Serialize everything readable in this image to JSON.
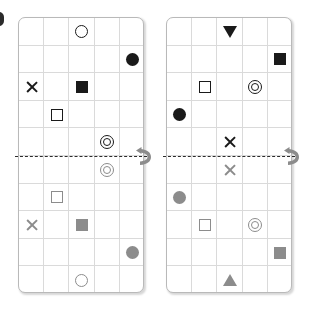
{
  "figure": {
    "kind": "mirror-reflection-grid-puzzle",
    "panel_count": 2,
    "grid": {
      "columns": 5,
      "rows_per_half": 5,
      "total_rows": 10
    },
    "mirror": {
      "orientation": "horizontal",
      "line_style": "dashed",
      "line_color": "#2b2b2b",
      "position_row": 5,
      "icon_name": "flip-vertical-icon",
      "icon_label": "flip"
    },
    "colors": {
      "source_symbol": "#1a1a1a",
      "reflected_symbol": "#8c8c8c",
      "grid_line": "#dadada",
      "panel_border": "#b9b9b9",
      "background": "#ffffff"
    }
  },
  "panels": [
    {
      "id": "panel-left",
      "name": "left-panel",
      "source_symbols": [
        {
          "row": 1,
          "col": 3,
          "shape": "circle-outline",
          "label": "open circle"
        },
        {
          "row": 2,
          "col": 5,
          "shape": "circle-filled",
          "label": "filled circle"
        },
        {
          "row": 3,
          "col": 1,
          "shape": "cross",
          "label": "cross"
        },
        {
          "row": 3,
          "col": 3,
          "shape": "square-filled",
          "label": "filled square"
        },
        {
          "row": 4,
          "col": 2,
          "shape": "square-outline",
          "label": "open square"
        },
        {
          "row": 5,
          "col": 4,
          "shape": "double-circle",
          "label": "double circle"
        }
      ],
      "reflected_symbols": [
        {
          "row": 6,
          "col": 4,
          "shape": "double-circle",
          "label": "double circle"
        },
        {
          "row": 7,
          "col": 2,
          "shape": "square-outline",
          "label": "open square"
        },
        {
          "row": 8,
          "col": 1,
          "shape": "cross",
          "label": "cross"
        },
        {
          "row": 8,
          "col": 3,
          "shape": "square-filled",
          "label": "filled square"
        },
        {
          "row": 9,
          "col": 5,
          "shape": "circle-filled",
          "label": "filled circle"
        },
        {
          "row": 10,
          "col": 3,
          "shape": "circle-outline",
          "label": "open circle"
        }
      ]
    },
    {
      "id": "panel-right",
      "name": "right-panel",
      "source_symbols": [
        {
          "row": 1,
          "col": 3,
          "shape": "triangle-down",
          "label": "down triangle"
        },
        {
          "row": 2,
          "col": 5,
          "shape": "square-filled",
          "label": "filled square"
        },
        {
          "row": 3,
          "col": 2,
          "shape": "square-outline",
          "label": "open square"
        },
        {
          "row": 3,
          "col": 4,
          "shape": "double-circle",
          "label": "double circle"
        },
        {
          "row": 4,
          "col": 1,
          "shape": "circle-filled",
          "label": "filled circle"
        },
        {
          "row": 5,
          "col": 3,
          "shape": "cross",
          "label": "cross"
        }
      ],
      "reflected_symbols": [
        {
          "row": 6,
          "col": 3,
          "shape": "cross",
          "label": "cross"
        },
        {
          "row": 7,
          "col": 1,
          "shape": "circle-filled",
          "label": "filled circle"
        },
        {
          "row": 8,
          "col": 2,
          "shape": "square-outline",
          "label": "open square"
        },
        {
          "row": 8,
          "col": 4,
          "shape": "double-circle",
          "label": "double circle"
        },
        {
          "row": 9,
          "col": 5,
          "shape": "square-filled",
          "label": "filled square"
        },
        {
          "row": 10,
          "col": 3,
          "shape": "triangle-up",
          "label": "up triangle"
        }
      ]
    }
  ]
}
